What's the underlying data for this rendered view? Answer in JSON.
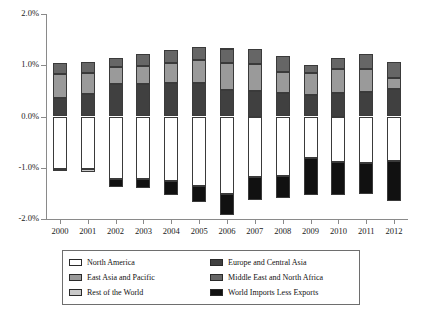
{
  "chart_data": {
    "type": "bar",
    "title": "",
    "subtitle": "",
    "xlabel": "",
    "ylabel": "",
    "stacked": true,
    "grid": false,
    "legend_position": "bottom",
    "ylim": [
      -2.0,
      2.0
    ],
    "y_ticks": [
      "2.0%",
      "1.0%",
      "0.0%",
      "-1.0%",
      "-2.0%"
    ],
    "y_tick_values": [
      2.0,
      1.0,
      0.0,
      -1.0,
      -2.0
    ],
    "categories": [
      "2000",
      "2001",
      "2002",
      "2003",
      "2004",
      "2005",
      "2006",
      "2007",
      "2008",
      "2009",
      "2010",
      "2011",
      "2012"
    ],
    "series": [
      {
        "name": "North America",
        "color": "#ffffff",
        "values": [
          -1.03,
          -1.02,
          -1.22,
          -1.21,
          -1.26,
          -1.36,
          -1.52,
          -1.18,
          -1.17,
          -0.8,
          -0.88,
          -0.9,
          -0.87
        ]
      },
      {
        "name": "Europe and Central Asia",
        "color": "#404040",
        "values": [
          0.36,
          0.43,
          0.63,
          0.63,
          0.66,
          0.66,
          0.52,
          0.5,
          0.46,
          0.42,
          0.45,
          0.48,
          0.53
        ]
      },
      {
        "name": "East Asia and Pacific",
        "color": "#9a9a9a",
        "values": [
          0.47,
          0.41,
          0.34,
          0.36,
          0.39,
          0.44,
          0.53,
          0.52,
          0.4,
          0.42,
          0.48,
          0.44,
          0.23
        ]
      },
      {
        "name": "Middle East and North Africa",
        "color": "#666666",
        "values": [
          0.21,
          0.23,
          0.17,
          0.22,
          0.25,
          0.26,
          0.26,
          0.3,
          0.33,
          0.16,
          0.22,
          0.3,
          0.31
        ]
      },
      {
        "name": "Rest of the World",
        "color": "#c9c9c9",
        "values": [
          -0.04,
          -0.06,
          0.0,
          0.0,
          0.0,
          0.0,
          0.03,
          0.0,
          0.0,
          0.0,
          0.0,
          0.0,
          0.0
        ]
      },
      {
        "name": "World Imports Less Exports",
        "color": "#111111",
        "values": [
          0.0,
          0.0,
          -0.15,
          -0.18,
          -0.27,
          -0.3,
          -0.4,
          -0.44,
          -0.42,
          -0.74,
          -0.65,
          -0.61,
          -0.78
        ]
      }
    ],
    "totals_positive": [
      1.04,
      1.07,
      1.14,
      1.21,
      1.3,
      1.36,
      1.34,
      1.32,
      1.19,
      1.0,
      1.15,
      1.22,
      1.07
    ]
  },
  "legend": {
    "entries": [
      {
        "label": "North America",
        "swatch": "swatch-north-america"
      },
      {
        "label": "Europe and Central Asia",
        "swatch": "swatch-europe-central-asia"
      },
      {
        "label": "East Asia and Pacific",
        "swatch": "swatch-east-asia-pacific"
      },
      {
        "label": "Middle East and North Africa",
        "swatch": "swatch-middle-east-north-africa"
      },
      {
        "label": "Rest of the World",
        "swatch": "swatch-rest-of-world"
      },
      {
        "label": "World Imports Less Exports",
        "swatch": "swatch-world-imports-less-exports"
      }
    ]
  }
}
